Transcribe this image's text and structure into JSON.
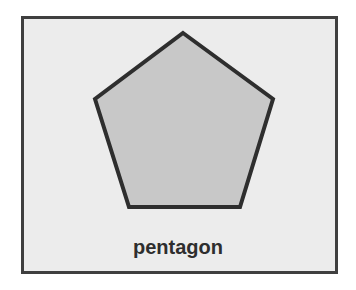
{
  "figure": {
    "label": "pentagon",
    "colors": {
      "background": "#ececec",
      "frame_border": "#3f3f3f",
      "shape_fill": "#c8c8c8",
      "shape_stroke": "#2e2e2e",
      "label_text": "#2e2e2e"
    },
    "shape": {
      "type": "pentagon",
      "points": "183,33 273,99 240,207 129,207 95,99"
    }
  }
}
